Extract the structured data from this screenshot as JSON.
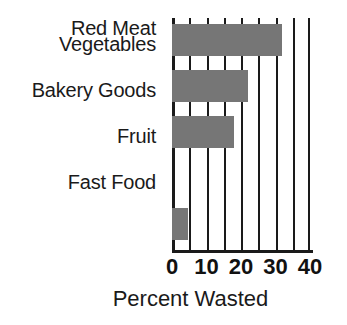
{
  "chart_data": {
    "type": "bar",
    "orientation": "horizontal",
    "title": "",
    "xlabel": "Percent Wasted",
    "ylabel": "",
    "categories": [
      "Vegetables",
      "Bakery Goods",
      "Fruit",
      "Fast Food",
      "Red Meat"
    ],
    "values": [
      32,
      22,
      18,
      6,
      4.5
    ],
    "xlim": [
      0,
      40
    ],
    "xticks": [
      0,
      10,
      20,
      30,
      40
    ],
    "xticklabels": [
      "0",
      "10",
      "20",
      "30",
      "40"
    ],
    "gridlines_every": 5,
    "gridlines": [
      0,
      5,
      10,
      15,
      20,
      25,
      30,
      35,
      40
    ],
    "grid": true,
    "legend": false,
    "colors": {
      "bar_fill": "#767676",
      "axis": "#1a1a1a",
      "text": "#1a1a1a",
      "background": "#ffffff"
    }
  }
}
